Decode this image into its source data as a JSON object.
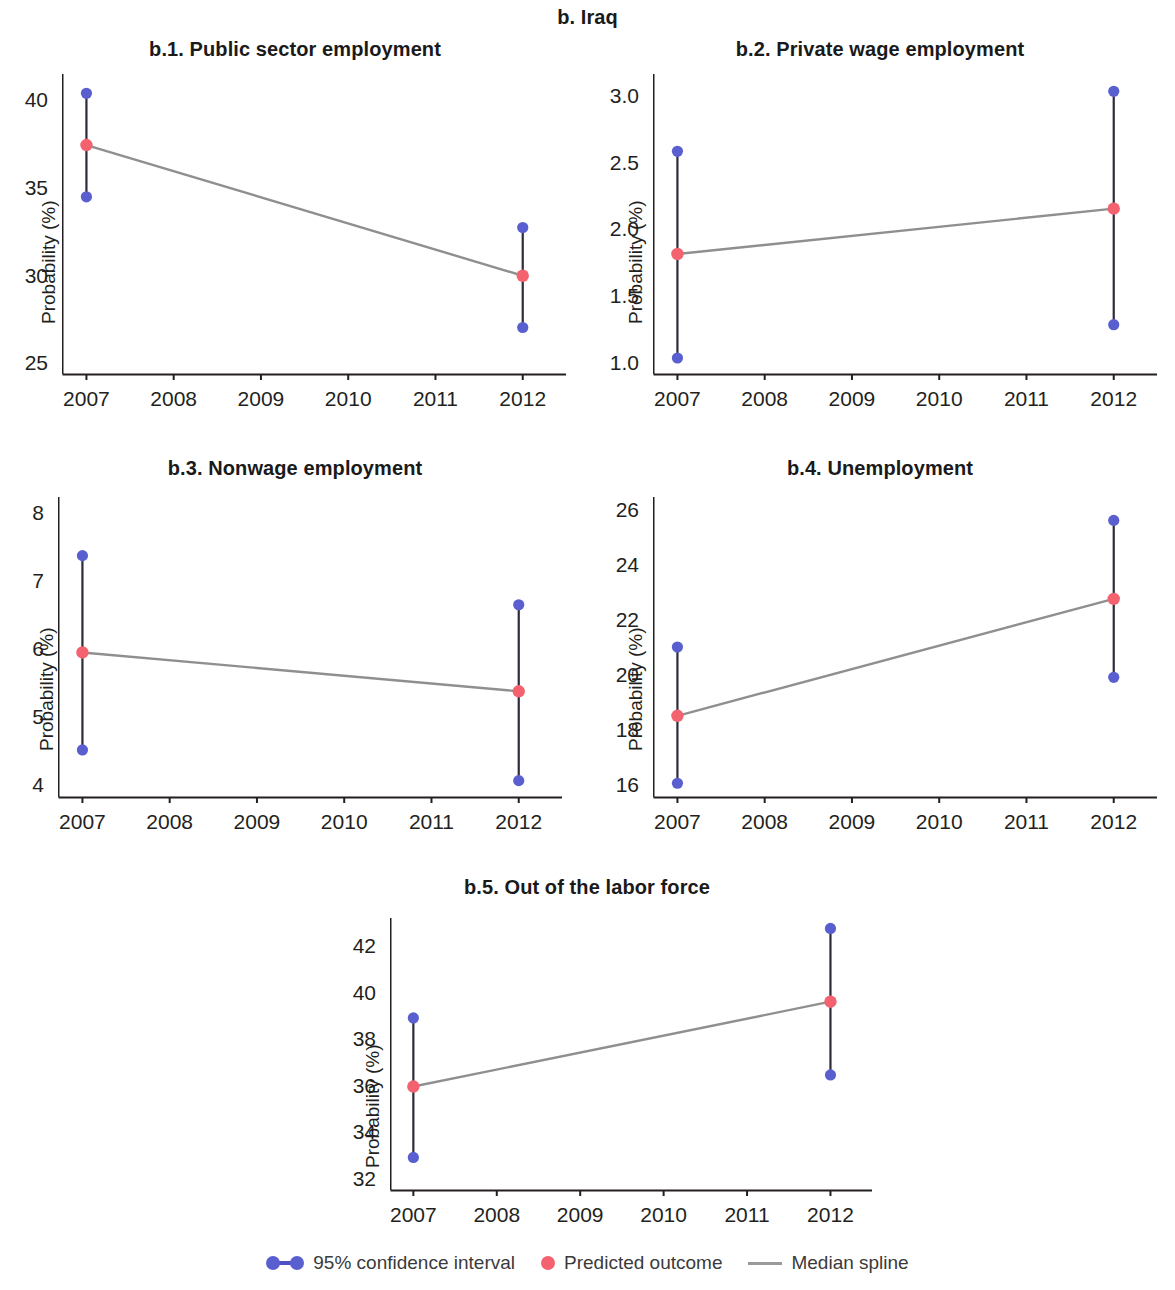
{
  "figure": {
    "title": "b. Iraq",
    "ylabel": "Probability (%)",
    "colors": {
      "ci_point": "#5a5fd0",
      "ci_line": "#2b2b3a",
      "predicted": "#f4626f",
      "spline": "#8f8f8f",
      "axis": "#231f20"
    }
  },
  "legend": {
    "items": [
      {
        "label": "95% confidence interval",
        "marker": "ci-dumbbell-marker"
      },
      {
        "label": "Predicted outcome",
        "marker": "red-dot-marker"
      },
      {
        "label": "Median spline",
        "marker": "gray-line-marker"
      }
    ]
  },
  "chart_data": [
    {
      "id": "b1",
      "type": "line",
      "title": "b.1. Public sector employment",
      "xlabel": "",
      "ylabel": "Probability (%)",
      "x": [
        2007,
        2012
      ],
      "xtick_labels": [
        "2007",
        "2008",
        "2009",
        "2010",
        "2011",
        "2012"
      ],
      "xlim": [
        2006.72,
        2012.45
      ],
      "ylim": [
        24.5,
        41.6
      ],
      "yticks": [
        25,
        30,
        35,
        40
      ],
      "ytick_labels": [
        "25",
        "30",
        "35",
        "40"
      ],
      "grid": false,
      "series": [
        {
          "name": "Predicted outcome",
          "values": [
            37.55,
            30.1
          ]
        },
        {
          "name": "95% CI lower",
          "values": [
            34.6,
            27.15
          ]
        },
        {
          "name": "95% CI upper",
          "values": [
            40.5,
            32.85
          ]
        },
        {
          "name": "Median spline",
          "values": [
            37.55,
            30.1
          ]
        }
      ]
    },
    {
      "id": "b2",
      "type": "line",
      "title": "b.2. Private wage employment",
      "xlabel": "",
      "ylabel": "Probability (%)",
      "x": [
        2007,
        2012
      ],
      "xtick_labels": [
        "2007",
        "2008",
        "2009",
        "2010",
        "2011",
        "2012"
      ],
      "xlim": [
        2006.72,
        2012.45
      ],
      "ylim": [
        0.93,
        3.18
      ],
      "yticks": [
        1.0,
        1.5,
        2.0,
        2.5,
        3.0
      ],
      "ytick_labels": [
        "1.0",
        "1.5",
        "2.0",
        "2.5",
        "3.0"
      ],
      "grid": false,
      "series": [
        {
          "name": "Predicted outcome",
          "values": [
            1.83,
            2.17
          ]
        },
        {
          "name": "95% CI lower",
          "values": [
            1.05,
            1.3
          ]
        },
        {
          "name": "95% CI upper",
          "values": [
            2.6,
            3.05
          ]
        },
        {
          "name": "Median spline",
          "values": [
            1.83,
            2.17
          ]
        }
      ]
    },
    {
      "id": "b3",
      "type": "line",
      "title": "b.3. Nonwage employment",
      "xlabel": "",
      "ylabel": "Probability (%)",
      "x": [
        2007,
        2012
      ],
      "xtick_labels": [
        "2007",
        "2008",
        "2009",
        "2010",
        "2011",
        "2012"
      ],
      "xlim": [
        2006.72,
        2012.45
      ],
      "ylim": [
        3.86,
        8.26
      ],
      "yticks": [
        4,
        5,
        6,
        7,
        8
      ],
      "ytick_labels": [
        "4",
        "5",
        "6",
        "7",
        "8"
      ],
      "grid": false,
      "series": [
        {
          "name": "Predicted outcome",
          "values": [
            5.98,
            5.41
          ]
        },
        {
          "name": "95% CI lower",
          "values": [
            4.55,
            4.1
          ]
        },
        {
          "name": "95% CI upper",
          "values": [
            7.4,
            6.68
          ]
        },
        {
          "name": "Median spline",
          "values": [
            5.98,
            5.41
          ]
        }
      ]
    },
    {
      "id": "b4",
      "type": "line",
      "title": "b.4. Unemployment",
      "xlabel": "",
      "ylabel": "Probability (%)",
      "x": [
        2007,
        2012
      ],
      "xtick_labels": [
        "2007",
        "2008",
        "2009",
        "2010",
        "2011",
        "2012"
      ],
      "xlim": [
        2006.72,
        2012.45
      ],
      "ylim": [
        15.65,
        26.55
      ],
      "yticks": [
        16,
        18,
        20,
        22,
        24,
        26
      ],
      "ytick_labels": [
        "16",
        "18",
        "20",
        "22",
        "24",
        "26"
      ],
      "grid": false,
      "series": [
        {
          "name": "Predicted outcome",
          "values": [
            18.6,
            22.85
          ]
        },
        {
          "name": "95% CI lower",
          "values": [
            16.15,
            20.0
          ]
        },
        {
          "name": "95% CI upper",
          "values": [
            21.1,
            25.7
          ]
        },
        {
          "name": "Median spline",
          "values": [
            18.6,
            22.85
          ]
        }
      ]
    },
    {
      "id": "b5",
      "type": "line",
      "title": "b.5. Out of the labor force",
      "xlabel": "",
      "ylabel": "Probability (%)",
      "x": [
        2007,
        2012
      ],
      "xtick_labels": [
        "2007",
        "2008",
        "2009",
        "2010",
        "2011",
        "2012"
      ],
      "xlim": [
        2006.72,
        2012.45
      ],
      "ylim": [
        31.6,
        43.3
      ],
      "yticks": [
        32,
        34,
        36,
        38,
        40,
        42
      ],
      "ytick_labels": [
        "32",
        "34",
        "36",
        "38",
        "40",
        "42"
      ],
      "grid": false,
      "series": [
        {
          "name": "Predicted outcome",
          "values": [
            36.05,
            39.7
          ]
        },
        {
          "name": "95% CI lower",
          "values": [
            33.0,
            36.55
          ]
        },
        {
          "name": "95% CI upper",
          "values": [
            39.0,
            42.85
          ]
        },
        {
          "name": "Median spline",
          "values": [
            36.05,
            39.7
          ]
        }
      ]
    }
  ]
}
